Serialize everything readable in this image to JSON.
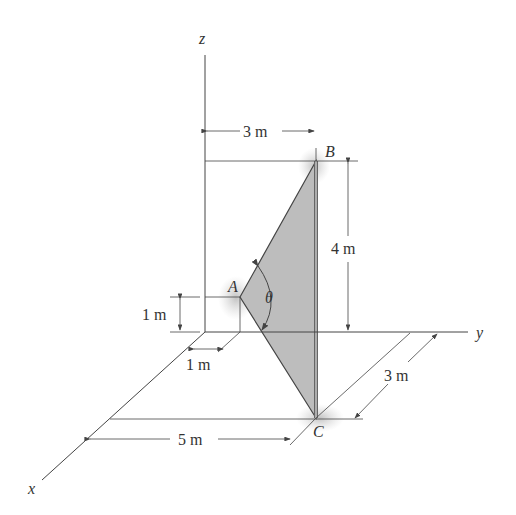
{
  "figure": {
    "axes": {
      "x_label": "x",
      "y_label": "y",
      "z_label": "z"
    },
    "points": {
      "A": "A",
      "B": "B",
      "C": "C"
    },
    "angle_label": "θ",
    "dimensions": {
      "top_width": "3 m",
      "height_B": "4 m",
      "height_A": "1 m",
      "offset_A": "1 m",
      "x_distance": "5 m",
      "depth_C": "3 m"
    },
    "colors": {
      "line": "#444444",
      "plate": "#bdbdbd",
      "glow": "#c8c8c8"
    }
  }
}
